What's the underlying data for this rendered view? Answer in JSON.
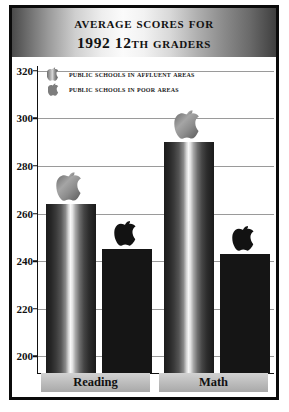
{
  "title": {
    "line1": "Average Scores for",
    "line2": "1992 12th Graders"
  },
  "legend": {
    "position": "top-left-inside-plot",
    "items": [
      {
        "label": "Public Schools in Affluent Areas",
        "icon": "apple-icon",
        "style": "metallic-gradient"
      },
      {
        "label": "Public Schools in Poor Areas",
        "icon": "apple-icon",
        "style": "solid-dark"
      }
    ]
  },
  "chart_data": {
    "type": "bar",
    "title": "Average Scores for 1992 12th Graders",
    "subtitle": "",
    "xlabel": "",
    "ylabel": "",
    "categories": [
      "Reading",
      "Math"
    ],
    "series": [
      {
        "name": "Public Schools in Affluent Areas",
        "values": [
          264,
          290
        ],
        "color": "#8a8a8a"
      },
      {
        "name": "Public Schools in Poor Areas",
        "values": [
          245,
          243
        ],
        "color": "#151515"
      }
    ],
    "ylim": [
      193,
      322
    ],
    "yticks": [
      200,
      220,
      240,
      260,
      280,
      300,
      320
    ],
    "ytick_labels": [
      "200",
      "220",
      "240",
      "260",
      "280",
      "300",
      "320"
    ],
    "grid": true,
    "grid_axis": "y",
    "legend_position": "upper left",
    "annotations": [
      "Apple logo marker sits above each bar"
    ]
  },
  "axis": {
    "y_ticks": [
      {
        "value": 320,
        "label": "320"
      },
      {
        "value": 300,
        "label": "300"
      },
      {
        "value": 280,
        "label": "280"
      },
      {
        "value": 260,
        "label": "260"
      },
      {
        "value": 240,
        "label": "240"
      },
      {
        "value": 220,
        "label": "220"
      },
      {
        "value": 200,
        "label": "200"
      }
    ],
    "categories": [
      {
        "label": "Reading"
      },
      {
        "label": "Math"
      }
    ]
  },
  "colors": {
    "frame": "#0b0b0b",
    "gridline": "#9a9a9a",
    "bar_affluent": "#8a8a8a",
    "bar_poor": "#151515",
    "band": "#bdbdbd",
    "text": "#111111"
  }
}
